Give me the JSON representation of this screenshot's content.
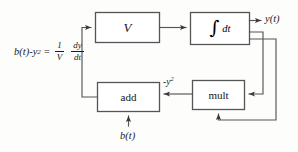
{
  "diagram": {
    "background_color": "#fdfdfc",
    "line_color": "#4a4a4a",
    "text_color": "#1a1a1a",
    "equation": {
      "lhs_main": "b(t)-y",
      "lhs_exponent": "2",
      "equals": "=",
      "frac1_numerator": "1",
      "frac1_denominator": "V",
      "frac2_numerator": "dy",
      "frac2_denominator": "dt"
    },
    "blocks": [
      {
        "id": "gain",
        "label": "V"
      },
      {
        "id": "integrator",
        "integral_sign": "∫",
        "label": "dt"
      },
      {
        "id": "adder",
        "label": "add"
      },
      {
        "id": "multiplier",
        "label": "mult"
      }
    ],
    "signals": {
      "output": "y(t)",
      "feedback_negative_y_squared_base": "-y",
      "feedback_negative_y_squared_exponent": "2",
      "input": "b(t)"
    }
  }
}
